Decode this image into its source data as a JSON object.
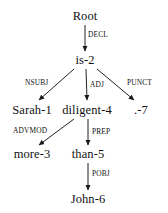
{
  "diagram": {
    "type": "dependency-tree",
    "sentence": "Sarah is more diligent than John .",
    "colors": {
      "background": "#ffffff",
      "text": "#111111",
      "edge": "#222222"
    },
    "nodes": [
      {
        "id": "root",
        "label": "Root",
        "x": 85,
        "y": 16,
        "index": null
      },
      {
        "id": "is",
        "label": "is-2",
        "x": 85,
        "y": 60,
        "index": 2
      },
      {
        "id": "sarah",
        "label": "Sarah-1",
        "x": 32,
        "y": 110,
        "index": 1
      },
      {
        "id": "diligent",
        "label": "diligent-4",
        "x": 87,
        "y": 110,
        "index": 4
      },
      {
        "id": "punct",
        "label": ".-7",
        "x": 141,
        "y": 110,
        "index": 7
      },
      {
        "id": "more",
        "label": "more-3",
        "x": 32,
        "y": 154,
        "index": 3
      },
      {
        "id": "than",
        "label": "than-5",
        "x": 88,
        "y": 154,
        "index": 5
      },
      {
        "id": "john",
        "label": "John-6",
        "x": 88,
        "y": 199,
        "index": 6
      }
    ],
    "edges": [
      {
        "id": "e-decl",
        "label": "DECL",
        "from": "root",
        "to": "is",
        "x1": 85,
        "y1": 25,
        "x2": 85,
        "y2": 51,
        "lx": 88,
        "ly": 35
      },
      {
        "id": "e-nsubj",
        "label": "NSUBJ",
        "from": "is",
        "to": "sarah",
        "x1": 74,
        "y1": 69,
        "x2": 39,
        "y2": 100,
        "lx": 25,
        "ly": 83
      },
      {
        "id": "e-adj",
        "label": "ADJ",
        "from": "is",
        "to": "diligent",
        "x1": 86,
        "y1": 69,
        "x2": 87,
        "y2": 100,
        "lx": 90,
        "ly": 85
      },
      {
        "id": "e-punct",
        "label": "PUNCT",
        "from": "is",
        "to": "punct",
        "x1": 97,
        "y1": 69,
        "x2": 134,
        "y2": 100,
        "lx": 127,
        "ly": 83
      },
      {
        "id": "e-advmod",
        "label": "ADVMOD",
        "from": "diligent",
        "to": "more",
        "x1": 74,
        "y1": 119,
        "x2": 39,
        "y2": 145,
        "lx": 13,
        "ly": 131
      },
      {
        "id": "e-prep",
        "label": "PREP",
        "from": "diligent",
        "to": "than",
        "x1": 88,
        "y1": 119,
        "x2": 88,
        "y2": 145,
        "lx": 92,
        "ly": 132
      },
      {
        "id": "e-pobj",
        "label": "POBJ",
        "from": "than",
        "to": "john",
        "x1": 88,
        "y1": 163,
        "x2": 88,
        "y2": 190,
        "lx": 92,
        "ly": 174
      }
    ]
  }
}
